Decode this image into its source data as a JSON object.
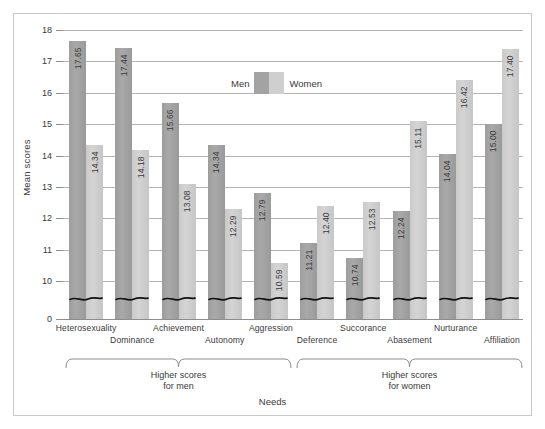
{
  "chart_data": {
    "type": "bar",
    "title": "",
    "xlabel": "Needs",
    "ylabel": "Mean scores",
    "ylim": [
      9.4,
      18
    ],
    "grid": true,
    "axis_break": true,
    "legend_position": "top-center",
    "yticks": [
      "18",
      "17",
      "16",
      "15",
      "14",
      "13",
      "12",
      "11",
      "10",
      "0"
    ],
    "categories": [
      "Heterosexuality",
      "Dominance",
      "Achievement",
      "Autonomy",
      "Aggression",
      "Deference",
      "Succorance",
      "Abasement",
      "Nurturance",
      "Affiliation"
    ],
    "series": [
      {
        "name": "Men",
        "color": "#a3a3a3",
        "values": [
          17.65,
          17.44,
          15.66,
          14.34,
          12.79,
          11.21,
          10.74,
          12.24,
          14.04,
          15.0
        ],
        "labels": [
          "17.65",
          "17.44",
          "15.66",
          "14.34",
          "12.79",
          "11.21",
          "10.74",
          "12.24",
          "14.04",
          "15.00"
        ]
      },
      {
        "name": "Women",
        "color": "#cfcfcf",
        "values": [
          14.34,
          14.18,
          13.08,
          12.29,
          10.59,
          12.4,
          12.53,
          15.11,
          16.42,
          17.4
        ],
        "labels": [
          "14.34",
          "14.18",
          "13.08",
          "12.29",
          "10.59",
          "12.40",
          "12.53",
          "15.11",
          "16.42",
          "17.40"
        ]
      }
    ],
    "annotations": [
      {
        "text": "Higher scores\nfor men",
        "line1": "Higher scores",
        "line2": "for men",
        "covers": [
          0,
          4
        ]
      },
      {
        "text": "Higher scores\nfor women",
        "line1": "Higher scores",
        "line2": "for women",
        "covers": [
          5,
          9
        ]
      }
    ]
  },
  "legend": {
    "men_label": "Men",
    "women_label": "Women"
  },
  "axes": {
    "ylabel": "Mean scores",
    "xlabel": "Needs"
  },
  "brackets": {
    "left_line1": "Higher scores",
    "left_line2": "for men",
    "right_line1": "Higher scores",
    "right_line2": "for women"
  }
}
